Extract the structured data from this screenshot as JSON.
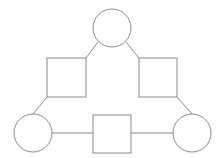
{
  "canvas": {
    "width": 222,
    "height": 158,
    "background_color": "#ffffff"
  },
  "diagram": {
    "title": "",
    "type": "node-link-graph",
    "stroke_color": "#8a8a8a",
    "node_fill_color": "#ffffff",
    "stroke_width": 1,
    "node_count": 6,
    "edge_count": 6,
    "nodes": [
      {
        "id": "top-circle",
        "shape": "circle",
        "label": "",
        "cx": 112,
        "cy": 28,
        "r": 19,
        "stroke": "#8a8a8a",
        "fill": "#ffffff"
      },
      {
        "id": "left-square",
        "shape": "square",
        "label": "",
        "x": 47,
        "y": 58,
        "width": 39,
        "height": 39,
        "stroke": "#8a8a8a",
        "fill": "#ffffff"
      },
      {
        "id": "right-square",
        "shape": "square",
        "label": "",
        "x": 139,
        "y": 58,
        "width": 38,
        "height": 39,
        "stroke": "#8a8a8a",
        "fill": "#ffffff"
      },
      {
        "id": "bottom-left-circle",
        "shape": "circle",
        "label": "",
        "cx": 33,
        "cy": 133,
        "r": 19,
        "stroke": "#8a8a8a",
        "fill": "#ffffff"
      },
      {
        "id": "bottom-center-square",
        "shape": "square",
        "label": "",
        "x": 93,
        "y": 115,
        "width": 38,
        "height": 38,
        "stroke": "#8a8a8a",
        "fill": "#ffffff"
      },
      {
        "id": "bottom-right-circle",
        "shape": "circle",
        "label": "",
        "cx": 192,
        "cy": 133,
        "r": 19,
        "stroke": "#8a8a8a",
        "fill": "#ffffff"
      }
    ],
    "edges": [
      {
        "id": "edge-top-circle-left-square",
        "from": "top-circle",
        "to": "left-square",
        "orientation": "diagonal",
        "x1": 98,
        "y1": 42,
        "x2": 86,
        "y2": 58
      },
      {
        "id": "edge-top-circle-right-square",
        "from": "top-circle",
        "to": "right-square",
        "orientation": "diagonal",
        "x1": 126,
        "y1": 42,
        "x2": 139,
        "y2": 58
      },
      {
        "id": "edge-left-square-bottom-left-circle",
        "from": "left-square",
        "to": "bottom-left-circle",
        "orientation": "diagonal",
        "x1": 47,
        "y1": 97,
        "x2": 33,
        "y2": 114
      },
      {
        "id": "edge-right-square-bottom-right-circle",
        "from": "right-square",
        "to": "bottom-right-circle",
        "orientation": "diagonal",
        "x1": 177,
        "y1": 97,
        "x2": 192,
        "y2": 114
      },
      {
        "id": "edge-bottom-left-circle-bottom-center-square",
        "from": "bottom-left-circle",
        "to": "bottom-center-square",
        "orientation": "horizontal",
        "x1": 52,
        "y1": 133,
        "x2": 93,
        "y2": 133
      },
      {
        "id": "edge-bottom-center-square-bottom-right-circle",
        "from": "bottom-center-square",
        "to": "bottom-right-circle",
        "orientation": "horizontal",
        "x1": 131,
        "y1": 133,
        "x2": 173,
        "y2": 133
      }
    ]
  }
}
